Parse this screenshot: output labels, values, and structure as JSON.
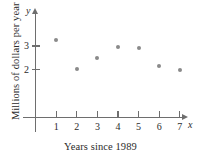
{
  "chart_data": {
    "type": "scatter",
    "title": "",
    "xlabel": "Years since 1989",
    "ylabel": "Millions of dollars per year",
    "x": [
      1,
      2,
      3,
      4,
      5,
      6,
      7
    ],
    "values": [
      3.25,
      2.05,
      2.5,
      2.95,
      2.9,
      2.15,
      2.0
    ],
    "points": [
      {
        "x": 1,
        "y": 3.25
      },
      {
        "x": 2,
        "y": 2.05
      },
      {
        "x": 3,
        "y": 2.5
      },
      {
        "x": 4,
        "y": 2.95
      },
      {
        "x": 5,
        "y": 2.9
      },
      {
        "x": 6,
        "y": 2.15
      },
      {
        "x": 7,
        "y": 2.0
      }
    ],
    "xticks": [
      "1",
      "2",
      "3",
      "4",
      "5",
      "6",
      "7"
    ],
    "yticks": [
      "2",
      "3"
    ],
    "xlim": [
      0,
      7.8
    ],
    "ylim": [
      0,
      3.9
    ],
    "grid": false,
    "legend": null,
    "x_axis_name": "x",
    "y_axis_name": "y",
    "point_color": "#8a8a8a",
    "axis_color": "#6e6e6e",
    "text_color": "#2b2b2b",
    "background": "#ffffff"
  },
  "axis": {
    "x_name": "x",
    "y_name": "y",
    "x_title": "Years since 1989",
    "y_title": "Millions of dollars per year"
  },
  "ticks": {
    "x": [
      {
        "label": "1"
      },
      {
        "label": "2"
      },
      {
        "label": "3"
      },
      {
        "label": "4"
      },
      {
        "label": "5"
      },
      {
        "label": "6"
      },
      {
        "label": "7"
      }
    ],
    "y": [
      {
        "label": "3"
      },
      {
        "label": "2"
      }
    ]
  }
}
